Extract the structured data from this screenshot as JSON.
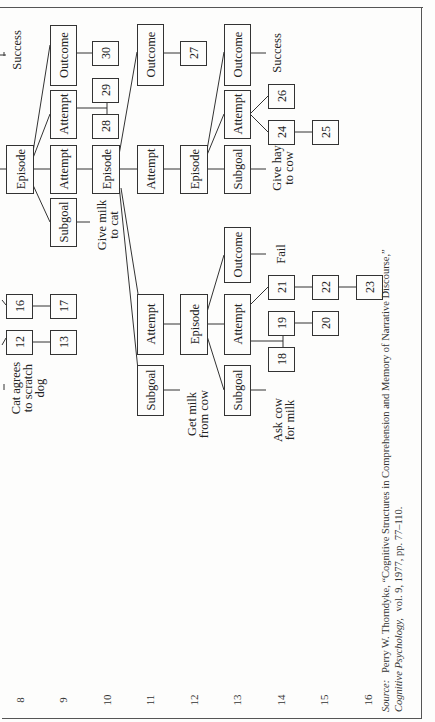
{
  "figure": {
    "orientation": "rotated-90-ccw",
    "levels": [
      {
        "label": "8",
        "x": 20
      },
      {
        "label": "9",
        "x": 63
      },
      {
        "label": "10",
        "x": 107
      },
      {
        "label": "11",
        "x": 150
      },
      {
        "label": "12",
        "x": 194
      },
      {
        "label": "13",
        "x": 237
      },
      {
        "label": "14",
        "x": 281
      },
      {
        "label": "15",
        "x": 324
      },
      {
        "label": "16",
        "x": 368
      }
    ],
    "nodes": [
      {
        "id": "ep9",
        "label": "Episode",
        "kind": "label",
        "x": 6,
        "y": 145,
        "w": 27,
        "h": 48
      },
      {
        "id": "sg9",
        "label": "Subgoal",
        "kind": "label",
        "x": 50,
        "y": 198,
        "w": 26,
        "h": 48
      },
      {
        "id": "att9a",
        "label": "Attempt",
        "kind": "label",
        "x": 50,
        "y": 145,
        "w": 26,
        "h": 48
      },
      {
        "id": "att9b",
        "label": "Attempt",
        "kind": "label",
        "x": 50,
        "y": 90,
        "w": 26,
        "h": 48
      },
      {
        "id": "out9",
        "label": "Outcome",
        "kind": "label",
        "x": 50,
        "y": 25,
        "w": 26,
        "h": 60
      },
      {
        "id": "n30",
        "label": "30",
        "kind": "number",
        "x": 92,
        "y": 41,
        "w": 26,
        "h": 24
      },
      {
        "id": "n29",
        "label": "29",
        "kind": "number",
        "x": 92,
        "y": 78,
        "w": 26,
        "h": 24
      },
      {
        "id": "n28",
        "label": "28",
        "kind": "number",
        "x": 92,
        "y": 114,
        "w": 26,
        "h": 24
      },
      {
        "id": "ep10",
        "label": "Episode",
        "kind": "label",
        "x": 92,
        "y": 145,
        "w": 27,
        "h": 48
      },
      {
        "id": "att10",
        "label": "Attempt",
        "kind": "label",
        "x": 137,
        "y": 145,
        "w": 26,
        "h": 48
      },
      {
        "id": "out10",
        "label": "Outcome",
        "kind": "label",
        "x": 137,
        "y": 24,
        "w": 26,
        "h": 61
      },
      {
        "id": "n27",
        "label": "27",
        "kind": "number",
        "x": 180,
        "y": 41,
        "w": 26,
        "h": 24
      },
      {
        "id": "ep12",
        "label": "Episode",
        "kind": "label",
        "x": 180,
        "y": 145,
        "w": 27,
        "h": 48
      },
      {
        "id": "sg13",
        "label": "Subgoal",
        "kind": "label",
        "x": 224,
        "y": 145,
        "w": 26,
        "h": 48
      },
      {
        "id": "att13",
        "label": "Attempt",
        "kind": "label",
        "x": 224,
        "y": 90,
        "w": 26,
        "h": 48
      },
      {
        "id": "out13",
        "label": "Outcome",
        "kind": "label",
        "x": 224,
        "y": 24,
        "w": 26,
        "h": 61
      },
      {
        "id": "n26",
        "label": "26",
        "kind": "number",
        "x": 268,
        "y": 84,
        "w": 26,
        "h": 24
      },
      {
        "id": "n24",
        "label": "24",
        "kind": "number",
        "x": 268,
        "y": 120,
        "w": 26,
        "h": 24
      },
      {
        "id": "n25",
        "label": "25",
        "kind": "number",
        "x": 312,
        "y": 120,
        "w": 26,
        "h": 24
      },
      {
        "id": "n12",
        "label": "12",
        "kind": "number",
        "x": 6,
        "y": 330,
        "w": 26,
        "h": 24
      },
      {
        "id": "n16",
        "label": "16",
        "kind": "number",
        "x": 6,
        "y": 294,
        "w": 26,
        "h": 24
      },
      {
        "id": "n13",
        "label": "13",
        "kind": "number",
        "x": 50,
        "y": 330,
        "w": 26,
        "h": 24
      },
      {
        "id": "n17",
        "label": "17",
        "kind": "number",
        "x": 50,
        "y": 294,
        "w": 26,
        "h": 24
      },
      {
        "id": "sg11",
        "label": "Subgoal",
        "kind": "label",
        "x": 137,
        "y": 365,
        "w": 26,
        "h": 50
      },
      {
        "id": "att11",
        "label": "Attempt",
        "kind": "label",
        "x": 137,
        "y": 294,
        "w": 26,
        "h": 60
      },
      {
        "id": "ep12b",
        "label": "Episode",
        "kind": "label",
        "x": 180,
        "y": 294,
        "w": 27,
        "h": 60
      },
      {
        "id": "sg13b",
        "label": "Subgoal",
        "kind": "label",
        "x": 224,
        "y": 365,
        "w": 26,
        "h": 50
      },
      {
        "id": "att13b",
        "label": "Attempt",
        "kind": "label",
        "x": 224,
        "y": 294,
        "w": 26,
        "h": 60
      },
      {
        "id": "out13b",
        "label": "Outcome",
        "kind": "label",
        "x": 224,
        "y": 227,
        "w": 26,
        "h": 55
      },
      {
        "id": "n21",
        "label": "21",
        "kind": "number",
        "x": 268,
        "y": 275,
        "w": 26,
        "h": 24
      },
      {
        "id": "n22",
        "label": "22",
        "kind": "number",
        "x": 312,
        "y": 275,
        "w": 26,
        "h": 24
      },
      {
        "id": "n23",
        "label": "23",
        "kind": "number",
        "x": 356,
        "y": 275,
        "w": 26,
        "h": 24
      },
      {
        "id": "n19",
        "label": "19",
        "kind": "number",
        "x": 268,
        "y": 311,
        "w": 26,
        "h": 24
      },
      {
        "id": "n20",
        "label": "20",
        "kind": "number",
        "x": 312,
        "y": 311,
        "w": 26,
        "h": 24
      },
      {
        "id": "n18",
        "label": "18",
        "kind": "number",
        "x": 268,
        "y": 347,
        "w": 26,
        "h": 24
      }
    ],
    "annotations": [
      {
        "id": "success-top",
        "lines": [
          "Success"
        ],
        "x": 12,
        "y": 50
      },
      {
        "id": "give-milk",
        "lines": [
          "Give milk",
          "to cat"
        ],
        "x": 97,
        "y": 225
      },
      {
        "id": "give-hay",
        "lines": [
          "Give hay",
          "to cow"
        ],
        "x": 272,
        "y": 168
      },
      {
        "id": "success-right",
        "lines": [
          "Success"
        ],
        "x": 272,
        "y": 53
      },
      {
        "id": "cat-agrees",
        "lines": [
          "Cat agrees",
          "to scratch",
          "dog"
        ],
        "x": 11,
        "y": 388
      },
      {
        "id": "get-milk",
        "lines": [
          "Get milk",
          "from cow"
        ],
        "x": 187,
        "y": 414
      },
      {
        "id": "ask-cow",
        "lines": [
          "Ask cow",
          "for milk"
        ],
        "x": 273,
        "y": 420
      },
      {
        "id": "fail",
        "lines": [
          "Fail"
        ],
        "x": 276,
        "y": 254
      }
    ]
  },
  "source": {
    "label": "Source:",
    "line1": "Perry W. Thorndyke, “Cognitive Structures in Comprehension and Memory of Narrative Discourse,”",
    "journal": "Cognitive Psychology,",
    "line2_rest": "vol. 9, 1977, pp. 77–110."
  }
}
